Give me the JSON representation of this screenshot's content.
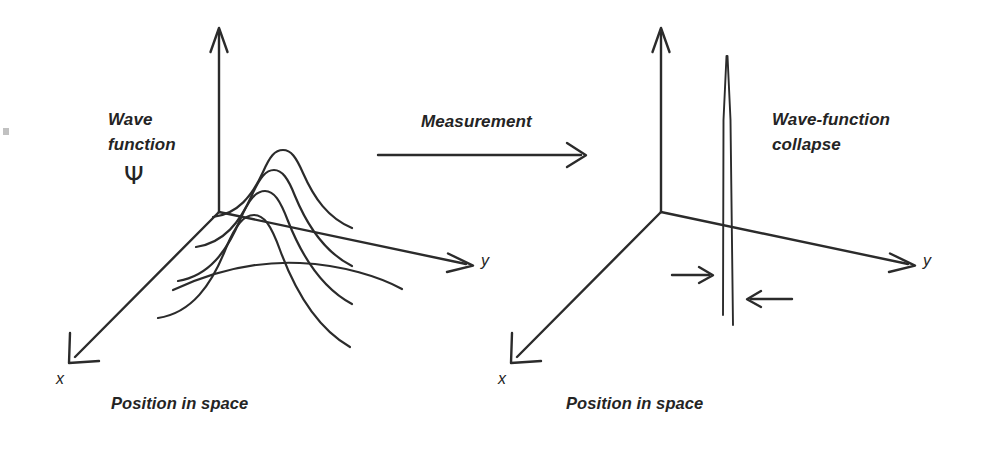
{
  "figure": {
    "background_color": "#ffffff",
    "ink_color": "#2b2b2b",
    "text_color": "#242424",
    "width": 981,
    "height": 452
  },
  "left_panel": {
    "annotation_line1": "Wave",
    "annotation_line2": "function",
    "psi_symbol": "Ψ",
    "axis_x_label": "x",
    "axis_y_label": "y",
    "caption": "Position in space",
    "curve_description": "spread gaussian wave packet drawn as nested bell curves"
  },
  "transition": {
    "label": "Measurement",
    "arrow_direction": "right"
  },
  "right_panel": {
    "annotation_line1": "Wave-function",
    "annotation_line2": "collapse",
    "axis_x_label": "x",
    "axis_y_label": "y",
    "caption": "Position in space",
    "spike_description": "collapsed delta-function spike",
    "collapse_arrow_left": "arrow pointing right toward spike",
    "collapse_arrow_right": "arrow pointing left toward spike"
  }
}
